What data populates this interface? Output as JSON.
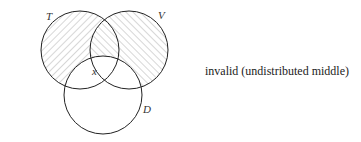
{
  "diagram": {
    "type": "venn-syllogism",
    "circles": [
      {
        "id": "T",
        "label": "T",
        "cx": 80,
        "cy": 50,
        "r": 39,
        "hatch": "backslash"
      },
      {
        "id": "V",
        "label": "V",
        "cx": 129,
        "cy": 50,
        "r": 39,
        "hatch": "slash"
      },
      {
        "id": "D",
        "label": "D",
        "cx": 103,
        "cy": 95,
        "r": 39,
        "hatch": "none"
      }
    ],
    "marker": {
      "label": "x"
    },
    "verdict": "invalid (undistributed middle)",
    "colors": {
      "stroke": "#222222",
      "hatch": "#9a9a9a",
      "background": "#ffffff"
    }
  }
}
